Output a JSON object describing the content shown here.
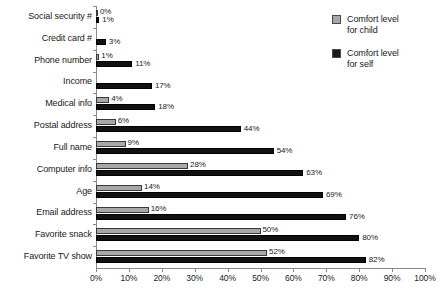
{
  "chart_data": {
    "type": "bar",
    "orientation": "horizontal",
    "title": "",
    "subtitle": "",
    "xlabel": "",
    "ylabel": "",
    "xlim": [
      0,
      100
    ],
    "xtick_labels": [
      "0%",
      "10%",
      "20%",
      "30%",
      "40%",
      "50%",
      "60%",
      "70%",
      "80%",
      "90%",
      "100%"
    ],
    "xtick_values": [
      0,
      10,
      20,
      30,
      40,
      50,
      60,
      70,
      80,
      90,
      100
    ],
    "grid": false,
    "legend_position": "top-right",
    "categories": [
      "Social security #",
      "Credit card #",
      "Phone number",
      "Income",
      "Medical info",
      "Postal address",
      "Full name",
      "Computer info",
      "Age",
      "Email address",
      "Favorite snack",
      "Favorite TV show"
    ],
    "series": [
      {
        "name": "Comfort level for child",
        "color": "#a8a8a8",
        "values": [
          0,
          null,
          1,
          null,
          4,
          6,
          9,
          28,
          14,
          16,
          50,
          52
        ],
        "labels": [
          "0%",
          "",
          "1%",
          "",
          "4%",
          "6%",
          "9%",
          "28%",
          "14%",
          "16%",
          "50%",
          "52%"
        ]
      },
      {
        "name": "Comfort level for self",
        "color": "#111111",
        "values": [
          1,
          3,
          11,
          17,
          18,
          44,
          54,
          63,
          69,
          76,
          80,
          82
        ],
        "labels": [
          "1%",
          "3%",
          "11%",
          "17%",
          "18%",
          "44%",
          "54%",
          "63%",
          "69%",
          "76%",
          "80%",
          "82%"
        ]
      }
    ]
  },
  "legend": {
    "items": [
      {
        "label_line1": "Comfort level",
        "label_line2": "for child",
        "swatch": "gray-swatch-icon"
      },
      {
        "label_line1": "Comfort level",
        "label_line2": "for self",
        "swatch": "black-swatch-icon"
      }
    ]
  }
}
